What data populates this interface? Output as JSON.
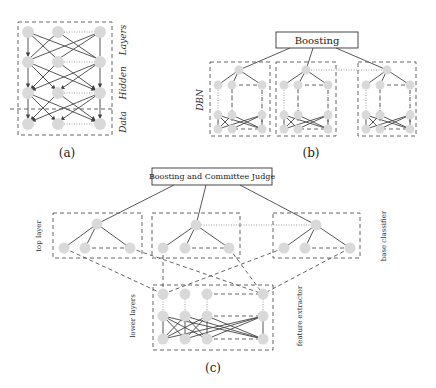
{
  "figure": {
    "panel_a": {
      "caption": "(a)",
      "labels": {
        "hidden": "Hidden",
        "layers": "Layers",
        "data": "Data"
      }
    },
    "panel_b": {
      "caption": "(b)",
      "top_box": "Boosting",
      "side_label": "DBN"
    },
    "panel_c": {
      "caption": "(c)",
      "top_box": "Boosting and Committee Judge",
      "labels": {
        "top_layer": "top layer",
        "base_classifier": "base classifier",
        "lower_layers": "lower layers",
        "feature_extractor": "feature extractor"
      }
    }
  }
}
